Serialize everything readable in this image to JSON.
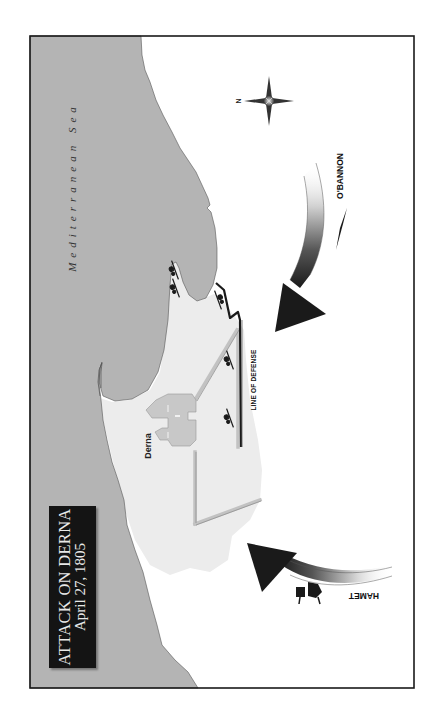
{
  "map": {
    "title": "ATTACK ON DERNA",
    "date": "April 27, 1805",
    "sea_label": "Mediterranean Sea",
    "town_label": "Derna",
    "defense_label": "LINE OF DEFENSE",
    "forces": [
      {
        "name": "O'BANNON",
        "direction": "from north-east, attacking the harbor defenses"
      },
      {
        "name": "HAMET",
        "direction": "from south, attacking the town"
      }
    ],
    "compass": {
      "north_label": "N",
      "north_direction": "left"
    },
    "colors": {
      "sea": "#b4b4b4",
      "town": "#ededed",
      "land": "#ffffff",
      "wall": "#c4c4c4",
      "defense_line": "#1a1a1a",
      "title_box": "#141414",
      "arrow": "#1a1a1a"
    }
  }
}
